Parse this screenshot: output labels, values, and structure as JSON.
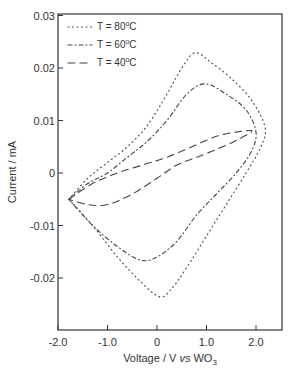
{
  "chart_data": {
    "type": "line",
    "title": "",
    "xlabel": "Voltage / V vs WO3",
    "ylabel": "Current / mA",
    "xlim": [
      -2.0,
      2.5
    ],
    "ylim": [
      -0.03,
      0.03
    ],
    "grid": false,
    "legend_position": "upper left",
    "x_ticks": [
      "-2.0",
      "-1.0",
      "0",
      "1.0",
      "2.0"
    ],
    "x_tick_values": [
      -2.0,
      -1.0,
      0,
      1.0,
      2.0
    ],
    "y_ticks": [
      "0.03",
      "0.02",
      "0.01",
      "0",
      "-0.01",
      "-0.02"
    ],
    "y_tick_values": [
      0.03,
      0.02,
      0.01,
      0,
      -0.01,
      -0.02
    ],
    "series": [
      {
        "name": "T = 80°C",
        "style": "dotted",
        "x": [
          -1.78,
          -1.4,
          -1.0,
          -0.6,
          -0.2,
          0.2,
          0.5,
          0.77,
          1.1,
          1.5,
          1.9,
          2.18,
          2.1,
          1.8,
          1.4,
          1.0,
          0.6,
          0.3,
          0.06,
          -0.3,
          -0.8,
          -1.3,
          -1.78
        ],
        "y": [
          -0.005,
          -0.001,
          0.002,
          0.005,
          0.009,
          0.015,
          0.02,
          0.0229,
          0.021,
          0.018,
          0.014,
          0.0088,
          0.005,
          0.0,
          -0.006,
          -0.012,
          -0.018,
          -0.022,
          -0.0236,
          -0.021,
          -0.016,
          -0.01,
          -0.005
        ]
      },
      {
        "name": "T = 60°C",
        "style": "dash-dot",
        "x": [
          -1.78,
          -1.4,
          -1.0,
          -0.6,
          -0.2,
          0.2,
          0.6,
          0.97,
          1.4,
          1.8,
          2.0,
          1.9,
          1.6,
          1.2,
          0.8,
          0.4,
          0.0,
          -0.34,
          -0.8,
          -1.3,
          -1.78
        ],
        "y": [
          -0.005,
          -0.002,
          0.0,
          0.003,
          0.006,
          0.01,
          0.015,
          0.017,
          0.015,
          0.012,
          0.0078,
          0.004,
          0.0,
          -0.004,
          -0.008,
          -0.013,
          -0.016,
          -0.0166,
          -0.014,
          -0.01,
          -0.005
        ]
      },
      {
        "name": "T = 40°C",
        "style": "dashed",
        "x": [
          -1.78,
          -1.3,
          -0.8,
          -0.3,
          0.2,
          0.7,
          1.2,
          1.6,
          1.92,
          1.6,
          1.2,
          0.8,
          0.4,
          0.0,
          -0.5,
          -1.0,
          -1.4,
          -1.78
        ],
        "y": [
          -0.005,
          -0.002,
          0.0,
          0.0015,
          0.003,
          0.005,
          0.007,
          0.0078,
          0.008,
          0.0062,
          0.0045,
          0.003,
          0.0015,
          -0.001,
          -0.004,
          -0.006,
          -0.006,
          -0.005
        ]
      }
    ]
  },
  "legend": [
    {
      "label": "T = 80",
      "sup": "o",
      "unit": "C"
    },
    {
      "label": "T = 60",
      "sup": "o",
      "unit": "C"
    },
    {
      "label": "T = 40",
      "sup": "o",
      "unit": "C"
    }
  ],
  "axes": {
    "ylabel": "Current / mA",
    "xlabel_prefix": "Voltage / V ",
    "xlabel_italic": "vs",
    "xlabel_suffix": " WO",
    "xlabel_sub": "3"
  }
}
